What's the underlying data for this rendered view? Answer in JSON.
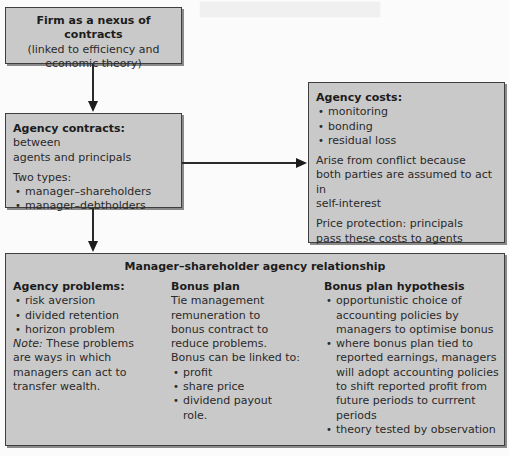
{
  "diagram": {
    "firm_box": {
      "title": "Firm as a nexus of contracts",
      "subtitle_line1": "(linked to efficiency and",
      "subtitle_line2": "economic theory)"
    },
    "contracts_box": {
      "title": "Agency contracts:",
      "title_rest": " between",
      "line2": "agents and principals",
      "types_label": "Two types:",
      "types": [
        "manager–shareholders",
        "manager–debtholders"
      ]
    },
    "costs_box": {
      "title": "Agency costs:",
      "items": [
        "monitoring",
        "bonding",
        "residual loss"
      ],
      "para1_lines": [
        "Arise from conflict because",
        "both parties are assumed to act in",
        "self-interest"
      ],
      "para2_lines": [
        "Price protection: principals",
        "pass these costs to agents"
      ]
    },
    "relationship_box": {
      "title": "Manager–shareholder agency relationship",
      "agency_problems": {
        "heading": "Agency problems:",
        "items": [
          "risk aversion",
          "divided retention",
          "horizon problem"
        ],
        "note_label": "Note:",
        "note_lines": [
          " These problems",
          "are ways in which",
          "managers can act to",
          "transfer wealth."
        ]
      },
      "bonus_plan": {
        "heading": "Bonus plan",
        "lines": [
          "Tie management",
          "remuneration to",
          "bonus contract to",
          "reduce problems.",
          "Bonus can be linked to:"
        ],
        "items": [
          "profit",
          "share price",
          "dividend payout"
        ],
        "items_tail": "role."
      },
      "bonus_hypothesis": {
        "heading": "Bonus plan hypothesis",
        "items": [
          [
            "opportunistic choice of",
            "accounting policies by",
            "managers to optimise bonus"
          ],
          [
            "where bonus plan tied to",
            "reported earnings, managers",
            "will adopt accounting policies",
            "to shift reported profit from",
            "future periods to currrent",
            "periods"
          ],
          [
            "theory tested by observation"
          ]
        ]
      }
    },
    "connectors": [
      {
        "from": "firm_box",
        "to": "contracts_box",
        "type": "arrow-down"
      },
      {
        "from": "contracts_box",
        "to": "costs_box",
        "type": "arrow-right"
      },
      {
        "from": "contracts_box",
        "to": "relationship_box",
        "type": "arrow-down"
      }
    ],
    "colors": {
      "box_fill": "#c9c9c9",
      "box_border": "#3e3e3e",
      "background": "#fbfbfb",
      "text": "#2a2a2a"
    }
  }
}
